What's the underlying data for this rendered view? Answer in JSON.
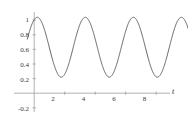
{
  "chart_data": {
    "type": "line",
    "title": "",
    "subtitle": "",
    "xlabel": "t",
    "ylabel": "",
    "xlim": [
      -0.45,
      10.25
    ],
    "ylim": [
      -0.28,
      1.16
    ],
    "grid": false,
    "legend": null,
    "line_color": "#555555",
    "axis_color": "#9a9a9a",
    "xticks": [
      2,
      4,
      6,
      8
    ],
    "xtick_labels": [
      "2",
      "4",
      "6",
      "8"
    ],
    "yticks": [
      0.2,
      0.4,
      0.6,
      0.8,
      1,
      -0.2
    ],
    "ytick_labels": [
      "0.2",
      "0.4",
      "0.6",
      "0.8",
      "1",
      "-0.2"
    ],
    "series": [
      {
        "name": "y(t)",
        "description": "oscillation, mean 0.63, amplitude 0.41, period about 3.15",
        "mean": 0.63,
        "amplitude": 0.41,
        "period": 3.15,
        "phase_peak_t": 0.2,
        "peaks_t": [
          0.2,
          3.35,
          6.5,
          9.65
        ],
        "peaks_y": [
          1.04,
          1.04,
          1.04,
          1.04
        ],
        "troughs_t": [
          1.35,
          4.5,
          7.65
        ],
        "troughs_y": [
          0.22,
          0.22,
          0.22
        ],
        "x": [
          -0.45,
          -0.3,
          -0.15,
          0,
          0.2,
          0.4,
          0.6,
          0.8,
          1.0,
          1.2,
          1.35,
          1.5,
          1.7,
          1.9,
          2.1,
          2.3,
          2.5,
          2.7,
          2.9,
          3.1,
          3.35,
          3.6,
          3.8,
          4.0,
          4.2,
          4.35,
          4.5,
          4.7,
          4.9,
          5.1,
          5.3,
          5.5,
          5.7,
          5.9,
          6.1,
          6.3,
          6.5,
          6.7,
          6.9,
          7.1,
          7.3,
          7.5,
          7.65,
          7.85,
          8.05,
          8.25,
          8.45,
          8.65,
          8.85,
          9.05,
          9.25,
          9.45,
          9.65,
          9.9,
          10.1,
          10.25
        ],
        "y": [
          0.92,
          0.98,
          1.02,
          1.035,
          1.04,
          1.015,
          0.95,
          0.85,
          0.72,
          0.45,
          0.235,
          0.225,
          0.23,
          0.28,
          0.37,
          0.48,
          0.6,
          0.72,
          0.83,
          0.94,
          1.04,
          1.03,
          0.99,
          0.9,
          0.6,
          0.3,
          0.225,
          0.23,
          0.26,
          0.33,
          0.43,
          0.55,
          0.67,
          0.78,
          0.89,
          0.98,
          1.04,
          1.03,
          0.98,
          0.88,
          0.6,
          0.3,
          0.225,
          0.23,
          0.28,
          0.38,
          0.5,
          0.63,
          0.75,
          0.86,
          0.95,
          1.01,
          1.04,
          1.03,
          0.98,
          0.94
        ]
      }
    ]
  },
  "axis": {
    "x_label": "t",
    "x_tick_labels": [
      "2",
      "4",
      "6",
      "8"
    ],
    "y_tick_labels": [
      "1",
      "0.8",
      "0.6",
      "0.4",
      "0.2",
      "-0.2"
    ]
  }
}
